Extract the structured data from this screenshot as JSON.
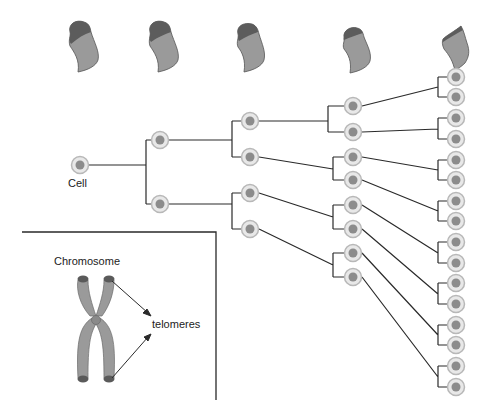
{
  "labels": {
    "cell": "Cell",
    "chromosome": "Chromosome",
    "telomeres": "telomeres"
  },
  "colors": {
    "line": "#2a2a2a",
    "cell_outer": "#e6e6e6",
    "cell_ring": "#bdbdbd",
    "cell_nucleus": "#8e8e8e",
    "chromosome_body": "#9a9a9a",
    "telomere_cap": "#5a5a5a"
  },
  "tree": {
    "levels": 5,
    "cells_per_level": [
      1,
      2,
      4,
      8,
      16
    ]
  },
  "chromosome_sequence": {
    "count": 5,
    "telomere_length_trend": "shortening"
  }
}
